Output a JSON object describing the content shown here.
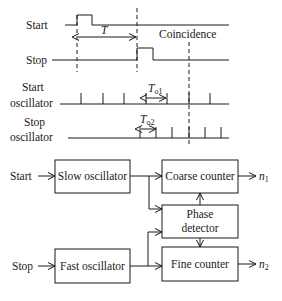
{
  "timing": {
    "signals": [
      {
        "id": "start",
        "label_lines": [
          "Start"
        ]
      },
      {
        "id": "stop",
        "label_lines": [
          "Stop"
        ]
      },
      {
        "id": "start_osc",
        "label_lines": [
          "Start",
          "oscillator"
        ]
      },
      {
        "id": "stop_osc",
        "label_lines": [
          "Stop",
          "oscillator"
        ]
      }
    ],
    "interval_label": "T",
    "coincidence_label": "Coincidence",
    "period1_label": {
      "main": "T",
      "sub": "o1"
    },
    "period2_label": {
      "main": "T",
      "sub": "o2"
    }
  },
  "block": {
    "inputs": {
      "start": "Start",
      "stop": "Stop"
    },
    "blocks": {
      "slow_osc": "Slow oscillator",
      "fast_osc": "Fast oscillator",
      "coarse": "Coarse counter",
      "phase": [
        "Phase",
        "detector"
      ],
      "fine": "Fine counter"
    },
    "outputs": {
      "n1": {
        "main": "n",
        "sub": "1"
      },
      "n2": {
        "main": "n",
        "sub": "2"
      }
    }
  },
  "colors": {
    "ink": "#1a1a1a",
    "background": "#ffffff"
  }
}
